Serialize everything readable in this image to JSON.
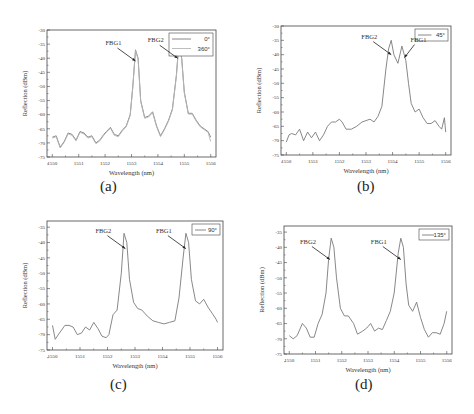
{
  "figure": {
    "panels": [
      "a",
      "b",
      "c",
      "d"
    ]
  },
  "chart_data": [
    {
      "id": "a",
      "type": "line",
      "sublabel": "(a)",
      "xlabel": "Wavelength (nm)",
      "ylabel": "Reflection (dBm)",
      "xlim": [
        1549.8,
        1556.2
      ],
      "ylim": [
        -75,
        -30
      ],
      "xticks": [
        1550,
        1551,
        1552,
        1553,
        1554,
        1555,
        1556
      ],
      "yticks": [
        -30,
        -35,
        -40,
        -45,
        -50,
        -55,
        -60,
        -65,
        -70,
        -75
      ],
      "legend": [
        "0°",
        "360°"
      ],
      "grid": false,
      "annotations": [
        {
          "text": "FBG1",
          "x": 1553.15,
          "y": -41
        },
        {
          "text": "FBG2",
          "x": 1554.75,
          "y": -40
        }
      ],
      "series": [
        {
          "name": "0°",
          "x": [
            1550.0,
            1550.15,
            1550.3,
            1550.45,
            1550.6,
            1550.75,
            1550.9,
            1551.05,
            1551.2,
            1551.35,
            1551.5,
            1551.65,
            1551.8,
            1551.95,
            1552.05,
            1552.2,
            1552.35,
            1552.5,
            1552.65,
            1552.8,
            1552.95,
            1553.05,
            1553.15,
            1553.25,
            1553.35,
            1553.5,
            1553.65,
            1553.8,
            1553.95,
            1554.1,
            1554.25,
            1554.4,
            1554.55,
            1554.7,
            1554.8,
            1554.9,
            1555.0,
            1555.15,
            1555.3,
            1555.45,
            1555.6,
            1555.75,
            1555.9,
            1556.0
          ],
          "y": [
            -68,
            -67.5,
            -71.5,
            -69.5,
            -66.5,
            -67,
            -69,
            -66,
            -66.5,
            -68,
            -67.5,
            -70,
            -69,
            -67,
            -66,
            -64.5,
            -67,
            -67.5,
            -65.5,
            -64,
            -60,
            -50,
            -37,
            -40,
            -55,
            -61,
            -60.5,
            -59,
            -64,
            -67.5,
            -65,
            -62,
            -58,
            -46,
            -34,
            -40,
            -52,
            -59.5,
            -59.5,
            -62,
            -64,
            -65,
            -66,
            -68
          ]
        },
        {
          "name": "360°",
          "x": [
            1550.0,
            1550.15,
            1550.3,
            1550.45,
            1550.6,
            1550.75,
            1550.9,
            1551.05,
            1551.2,
            1551.35,
            1551.5,
            1551.65,
            1551.8,
            1551.95,
            1552.05,
            1552.2,
            1552.35,
            1552.5,
            1552.65,
            1552.8,
            1552.95,
            1553.05,
            1553.15,
            1553.25,
            1553.35,
            1553.5,
            1553.65,
            1553.8,
            1553.95,
            1554.1,
            1554.25,
            1554.4,
            1554.55,
            1554.7,
            1554.8,
            1554.9,
            1555.0,
            1555.15,
            1555.3,
            1555.45,
            1555.6,
            1555.75,
            1555.9,
            1556.0
          ],
          "y": [
            -68.3,
            -67.8,
            -71.8,
            -69.8,
            -66.8,
            -67.3,
            -69.3,
            -66.3,
            -66.8,
            -68.3,
            -67.8,
            -70.3,
            -69.3,
            -67.3,
            -66.3,
            -64.8,
            -67.3,
            -67.8,
            -65.8,
            -64.3,
            -60.3,
            -50.3,
            -37.3,
            -40.3,
            -55.3,
            -61.3,
            -60.8,
            -59.3,
            -64.3,
            -67.8,
            -65.3,
            -62.3,
            -58.3,
            -46.3,
            -34.3,
            -40.3,
            -52.3,
            -59.8,
            -59.8,
            -62.3,
            -64.3,
            -65.3,
            -66.3,
            -69.5
          ]
        }
      ]
    },
    {
      "id": "b",
      "type": "line",
      "sublabel": "(b)",
      "xlabel": "Wavelength (nm)",
      "ylabel": "Reflection (dBm)",
      "xlim": [
        1549.8,
        1556.2
      ],
      "ylim": [
        -75,
        -30
      ],
      "xticks": [
        1550,
        1551,
        1552,
        1553,
        1554,
        1555,
        1556
      ],
      "yticks": [
        -30,
        -35,
        -40,
        -45,
        -50,
        -55,
        -60,
        -65,
        -70,
        -75
      ],
      "legend": [
        "45°"
      ],
      "grid": false,
      "annotations": [
        {
          "text": "FBG2",
          "x": 1553.95,
          "y": -40
        },
        {
          "text": "FBG1",
          "x": 1554.45,
          "y": -41
        }
      ],
      "series": [
        {
          "name": "45°",
          "x": [
            1550.0,
            1550.1,
            1550.2,
            1550.35,
            1550.5,
            1550.65,
            1550.8,
            1550.95,
            1551.1,
            1551.25,
            1551.4,
            1551.55,
            1551.7,
            1551.85,
            1552.0,
            1552.1,
            1552.25,
            1552.45,
            1552.65,
            1552.85,
            1553.0,
            1553.15,
            1553.3,
            1553.45,
            1553.6,
            1553.75,
            1553.85,
            1553.95,
            1554.05,
            1554.2,
            1554.35,
            1554.5,
            1554.6,
            1554.7,
            1554.85,
            1555.0,
            1555.15,
            1555.3,
            1555.45,
            1555.6,
            1555.75,
            1555.85,
            1555.95,
            1556.0
          ],
          "y": [
            -70.5,
            -68,
            -67.5,
            -68,
            -66,
            -70,
            -67,
            -69,
            -67,
            -70,
            -68,
            -65,
            -63.5,
            -63.5,
            -62.5,
            -63.5,
            -66,
            -66,
            -65,
            -63.5,
            -63,
            -62.5,
            -63.5,
            -61.5,
            -58,
            -45,
            -38,
            -35,
            -40,
            -43,
            -37,
            -42,
            -50,
            -57,
            -60,
            -59,
            -62,
            -64,
            -64,
            -63,
            -65,
            -66,
            -62,
            -67
          ]
        }
      ]
    },
    {
      "id": "c",
      "type": "line",
      "sublabel": "(c)",
      "xlabel": "Wavelength (nm)",
      "ylabel": "Reflection (dBm)",
      "xlim": [
        1549.8,
        1556.2
      ],
      "ylim": [
        -75,
        -33
      ],
      "xticks": [
        1550,
        1551,
        1552,
        1553,
        1554,
        1555,
        1556
      ],
      "yticks": [
        -35,
        -40,
        -45,
        -50,
        -55,
        -60,
        -65,
        -70,
        -75
      ],
      "legend": [
        "90°"
      ],
      "grid": false,
      "annotations": [
        {
          "text": "FBG2",
          "x": 1552.65,
          "y": -42
        },
        {
          "text": "FBG1",
          "x": 1554.85,
          "y": -42
        }
      ],
      "series": [
        {
          "name": "90°",
          "x": [
            1550.0,
            1550.1,
            1550.25,
            1550.45,
            1550.6,
            1550.75,
            1550.9,
            1551.05,
            1551.2,
            1551.35,
            1551.5,
            1551.65,
            1551.8,
            1551.95,
            1552.05,
            1552.2,
            1552.35,
            1552.5,
            1552.6,
            1552.7,
            1552.8,
            1552.95,
            1553.1,
            1553.25,
            1553.45,
            1553.65,
            1553.85,
            1554.05,
            1554.25,
            1554.45,
            1554.6,
            1554.75,
            1554.85,
            1554.95,
            1555.05,
            1555.2,
            1555.35,
            1555.5,
            1555.65,
            1555.8,
            1555.95,
            1556.0
          ],
          "y": [
            -67,
            -71.5,
            -69.5,
            -67,
            -67,
            -67.5,
            -70,
            -69.5,
            -67.5,
            -68.5,
            -66,
            -68,
            -70.5,
            -71,
            -70,
            -63.5,
            -62,
            -50,
            -37,
            -40,
            -52,
            -59.5,
            -61.5,
            -62,
            -64,
            -65.5,
            -66,
            -66.5,
            -66,
            -65.5,
            -58,
            -45,
            -37,
            -40,
            -52,
            -59,
            -60,
            -58.5,
            -61,
            -63,
            -65,
            -66
          ]
        }
      ]
    },
    {
      "id": "d",
      "type": "line",
      "sublabel": "(d)",
      "xlabel": "Wavelength (nm)",
      "ylabel": "Reflection (dBm)",
      "xlim": [
        1549.8,
        1556.2
      ],
      "ylim": [
        -75,
        -33
      ],
      "xticks": [
        1550,
        1551,
        1552,
        1553,
        1554,
        1555,
        1556
      ],
      "yticks": [
        -35,
        -40,
        -45,
        -50,
        -55,
        -60,
        -65,
        -70,
        -75
      ],
      "legend": [
        "135°"
      ],
      "grid": false,
      "annotations": [
        {
          "text": "FBG2",
          "x": 1551.55,
          "y": -44
        },
        {
          "text": "FBG1",
          "x": 1554.25,
          "y": -44
        }
      ],
      "series": [
        {
          "name": "135°",
          "x": [
            1550.0,
            1550.15,
            1550.3,
            1550.5,
            1550.65,
            1550.8,
            1550.95,
            1551.1,
            1551.25,
            1551.4,
            1551.5,
            1551.6,
            1551.7,
            1551.8,
            1551.95,
            1552.1,
            1552.25,
            1552.45,
            1552.6,
            1552.8,
            1552.95,
            1553.1,
            1553.25,
            1553.4,
            1553.55,
            1553.7,
            1553.85,
            1554.0,
            1554.15,
            1554.25,
            1554.35,
            1554.45,
            1554.55,
            1554.7,
            1554.85,
            1555.0,
            1555.15,
            1555.3,
            1555.45,
            1555.6,
            1555.75,
            1555.9,
            1556.0
          ],
          "y": [
            -69,
            -70,
            -69,
            -65,
            -66.5,
            -69.5,
            -69.5,
            -65,
            -62,
            -55,
            -44,
            -37,
            -40,
            -50,
            -60,
            -62.5,
            -62.5,
            -65,
            -68.5,
            -67.5,
            -66.5,
            -65,
            -67.5,
            -66.5,
            -67,
            -64,
            -61,
            -55,
            -42,
            -37,
            -40,
            -52,
            -59,
            -61,
            -58,
            -63,
            -67,
            -69.5,
            -68,
            -68,
            -68.5,
            -65,
            -61
          ]
        }
      ]
    }
  ],
  "layout": {
    "panels": [
      {
        "id": "a",
        "left": 47,
        "top": 30,
        "width": 169,
        "height": 127,
        "sub_x": 100,
        "sub_y": 178,
        "legend_w": 44,
        "legend_h": 23
      },
      {
        "id": "b",
        "left": 281,
        "top": 26,
        "width": 170,
        "height": 129,
        "sub_x": 357,
        "sub_y": 178,
        "legend_w": 33,
        "legend_h": 12
      },
      {
        "id": "c",
        "left": 47,
        "top": 221,
        "width": 176,
        "height": 129,
        "sub_x": 110,
        "sub_y": 376,
        "legend_w": 28,
        "legend_h": 11
      },
      {
        "id": "d",
        "left": 284,
        "top": 226,
        "width": 168,
        "height": 128,
        "sub_x": 355,
        "sub_y": 376,
        "legend_w": 30,
        "legend_h": 11
      }
    ],
    "line_color": "#7a7a7a",
    "line_color_2": "#b5b5b5",
    "axis_color": "#444444"
  }
}
